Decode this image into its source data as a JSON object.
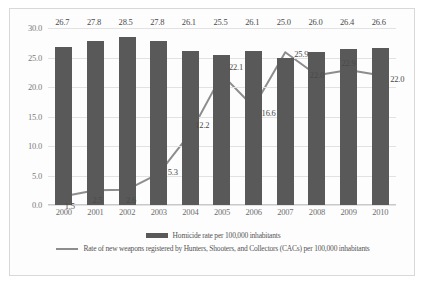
{
  "chart_data": {
    "type": "bar",
    "title": "",
    "subtitle": "",
    "xlabel": "",
    "ylabel": "",
    "categories": [
      "2000",
      "2001",
      "2002",
      "2003",
      "2004",
      "2005",
      "2006",
      "2007",
      "2008",
      "2009",
      "2010"
    ],
    "ylim": [
      0.0,
      30.0
    ],
    "y_ticks": [
      "0.0",
      "5.0",
      "10.0",
      "15.0",
      "20.0",
      "25.0",
      "30.0"
    ],
    "y_tick_values": [
      0.0,
      5.0,
      10.0,
      15.0,
      20.0,
      25.0,
      30.0
    ],
    "grid": true,
    "legend_position": "bottom",
    "series": [
      {
        "name": "Homicide rate per 100,000 inhabitants",
        "type": "bar",
        "color": "#595959",
        "values": [
          26.7,
          27.8,
          28.5,
          27.8,
          26.1,
          25.5,
          26.1,
          25.0,
          26.0,
          26.4,
          26.6
        ],
        "labels": [
          "26.7",
          "27.8",
          "28.5",
          "27.8",
          "26.1",
          "25.5",
          "26.1",
          "25.0",
          "26.0",
          "26.4",
          "26.6"
        ]
      },
      {
        "name": "Rate of new weapons registered by Hunters, Shooters, and Collectors (CACs) per 100,000 inhabitants",
        "type": "line",
        "color": "#8d8d8d",
        "values": [
          1.5,
          2.5,
          2.6,
          5.3,
          12.2,
          22.1,
          16.6,
          25.9,
          22.0,
          22.9,
          22.0
        ],
        "labels": [
          "1.5",
          "2.5",
          "2.6",
          "5.3",
          "12.2",
          "22.1",
          "16.6",
          "25.9",
          "22.0",
          "22.9",
          "22.0"
        ]
      }
    ]
  },
  "legend": {
    "items": [
      {
        "label": "Homicide rate per 100,000 inhabitants",
        "swatch": "bar-swatch",
        "color": "#595959"
      },
      {
        "label": "Rate of new weapons registered by Hunters, Shooters, and Collectors (CACs) per 100,000 inhabitants",
        "swatch": "line-swatch",
        "color": "#8d8d8d"
      }
    ]
  }
}
